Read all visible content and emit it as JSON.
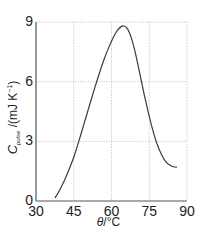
{
  "chart_data": {
    "type": "line",
    "title": "",
    "xlabel": "θ/°C",
    "ylabel": "C_pulse /(mJ K⁻¹)",
    "ylabel_parts": {
      "main": "C",
      "sub": "pulse",
      "unit": " /(mJ K",
      "sup": "−1",
      "close": ")"
    },
    "xlabel_parts": {
      "italic": "θ",
      "rest": "/°C"
    },
    "xlim": [
      30,
      90
    ],
    "ylim": [
      0,
      9
    ],
    "xticks": [
      30,
      45,
      60,
      75,
      90
    ],
    "yticks": [
      0,
      3,
      6,
      9
    ],
    "xtick_labels": [
      "30",
      "45",
      "60",
      "75",
      "90"
    ],
    "ytick_labels": [
      "0",
      "3",
      "6",
      "9"
    ],
    "grid": true,
    "legend": null,
    "series": [
      {
        "name": "C_pulse",
        "x": [
          37.5,
          39,
          41,
          43,
          45,
          47,
          49,
          51,
          53,
          55,
          57,
          59,
          61,
          62.5,
          64,
          65,
          66,
          67,
          68,
          69,
          70,
          71,
          72,
          73,
          74,
          75,
          76,
          77,
          78,
          79,
          80,
          81,
          82,
          83,
          84,
          85,
          86
        ],
        "y": [
          0.15,
          0.45,
          0.95,
          1.55,
          2.2,
          3.0,
          3.85,
          4.7,
          5.55,
          6.35,
          7.1,
          7.75,
          8.3,
          8.6,
          8.78,
          8.8,
          8.72,
          8.5,
          8.15,
          7.7,
          7.15,
          6.55,
          5.95,
          5.35,
          4.8,
          4.25,
          3.75,
          3.3,
          2.9,
          2.58,
          2.3,
          2.08,
          1.92,
          1.82,
          1.75,
          1.71,
          1.7
        ]
      }
    ]
  }
}
